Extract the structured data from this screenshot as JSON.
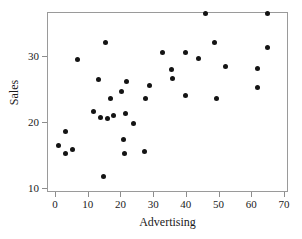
{
  "chart_data": {
    "type": "scatter",
    "title": "",
    "xlabel": "Advertising",
    "ylabel": "Sales",
    "xlim": [
      -2.4,
      70.0
    ],
    "ylim": [
      10.3,
      36.6
    ],
    "grid": false,
    "legend": null,
    "marker": {
      "shape": "circle",
      "color": "#141414",
      "size": 5
    },
    "xticks": [
      0,
      10,
      20,
      30,
      40,
      50,
      60,
      70
    ],
    "xticklabels": [
      "0",
      "10",
      "20",
      "30",
      "40",
      "50",
      "60",
      "70"
    ],
    "yticks": [
      10,
      20,
      30
    ],
    "yticklabels": [
      "10",
      "20",
      "30"
    ],
    "n_points": 36,
    "x": [
      1.2,
      3.2,
      3.2,
      5.2,
      7.0,
      11.9,
      13.9,
      14.7,
      15.5,
      16.0,
      17.0,
      18.0,
      20.4,
      21.0,
      21.2,
      21.6,
      22.0,
      24.0,
      27.3,
      27.8,
      29.0,
      33.0,
      35.6,
      36.0,
      40.0,
      40.0,
      44.0,
      46.0,
      48.8,
      49.5,
      52.0,
      62.0,
      62.0,
      65.0,
      65.0,
      13.2
    ],
    "y": [
      16.4,
      18.6,
      15.3,
      15.9,
      29.5,
      21.6,
      20.7,
      11.7,
      32.1,
      20.5,
      23.5,
      21.0,
      24.6,
      17.3,
      15.3,
      21.3,
      26.1,
      19.8,
      15.5,
      23.6,
      25.5,
      30.5,
      28.0,
      26.6,
      30.6,
      24.0,
      29.6,
      36.4,
      32.1,
      23.6,
      28.4,
      28.1,
      25.2,
      36.4,
      31.3,
      26.5
    ],
    "points": [
      {
        "x": 1.2,
        "y": 16.4
      },
      {
        "x": 3.2,
        "y": 18.6
      },
      {
        "x": 3.2,
        "y": 15.3
      },
      {
        "x": 5.2,
        "y": 15.9
      },
      {
        "x": 7.0,
        "y": 29.5
      },
      {
        "x": 11.9,
        "y": 21.6
      },
      {
        "x": 13.2,
        "y": 26.5
      },
      {
        "x": 13.9,
        "y": 20.7
      },
      {
        "x": 14.7,
        "y": 11.7
      },
      {
        "x": 15.5,
        "y": 32.1
      },
      {
        "x": 16.0,
        "y": 20.5
      },
      {
        "x": 17.0,
        "y": 23.5
      },
      {
        "x": 18.0,
        "y": 21.0
      },
      {
        "x": 20.4,
        "y": 24.6
      },
      {
        "x": 21.0,
        "y": 17.3
      },
      {
        "x": 21.2,
        "y": 15.3
      },
      {
        "x": 21.6,
        "y": 21.3
      },
      {
        "x": 22.0,
        "y": 26.1
      },
      {
        "x": 24.0,
        "y": 19.8
      },
      {
        "x": 27.3,
        "y": 15.5
      },
      {
        "x": 27.8,
        "y": 23.6
      },
      {
        "x": 29.0,
        "y": 25.5
      },
      {
        "x": 33.0,
        "y": 30.5
      },
      {
        "x": 35.6,
        "y": 28.0
      },
      {
        "x": 36.0,
        "y": 26.6
      },
      {
        "x": 40.0,
        "y": 30.6
      },
      {
        "x": 40.0,
        "y": 24.0
      },
      {
        "x": 44.0,
        "y": 29.6
      },
      {
        "x": 46.0,
        "y": 36.4
      },
      {
        "x": 48.8,
        "y": 32.1
      },
      {
        "x": 49.5,
        "y": 23.6
      },
      {
        "x": 52.0,
        "y": 28.4
      },
      {
        "x": 62.0,
        "y": 28.1
      },
      {
        "x": 62.0,
        "y": 25.2
      },
      {
        "x": 65.0,
        "y": 36.4
      },
      {
        "x": 65.0,
        "y": 31.3
      }
    ]
  }
}
